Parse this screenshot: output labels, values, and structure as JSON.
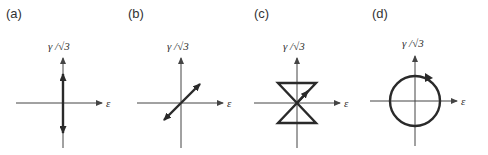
{
  "panels": [
    {
      "label": "(a)",
      "ylabel": "γ /√3",
      "xlabel": "ε",
      "path_type": "vertical-line",
      "description": "strain path along shear axis, arrows up and down"
    },
    {
      "label": "(b)",
      "ylabel": "γ /√3",
      "xlabel": "ε",
      "path_type": "diagonal-line",
      "description": "proportional path through origin, arrows both ends"
    },
    {
      "label": "(c)",
      "ylabel": "γ /√3",
      "xlabel": "ε",
      "path_type": "hourglass",
      "description": "butterfly / hourglass path with arrow"
    },
    {
      "label": "(d)",
      "ylabel": "γ /√3",
      "xlabel": "ε",
      "path_type": "circle",
      "description": "circular path, clockwise arrow"
    }
  ],
  "colors": {
    "line": "#2a2a2a",
    "axis": "#444444",
    "text": "#333333",
    "background": "#ffffff"
  }
}
